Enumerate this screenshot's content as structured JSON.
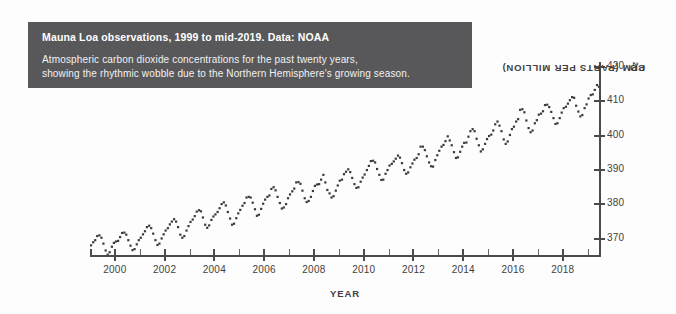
{
  "caption": {
    "title": "Mauna Loa observations, 1999 to mid-2019. Data: NOAA",
    "line1": "Atmospheric carbon dioxide concentrations for the past twenty years,",
    "line2": "showing the rhythmic wobble due to the Northern Hemisphere's growing season."
  },
  "colors": {
    "caption_background": "#58585a",
    "caption_text": "#ffffff",
    "axis": "#4b4b4d",
    "marker": "#3a3a3c",
    "page_background": "#fdfdfd"
  },
  "axis_titles": {
    "x": "YEAR",
    "y_prefix": "CO",
    "y_subscript": "2",
    "y_suffix": " PPM (PARTS PER MILLION)"
  },
  "chart_data": {
    "type": "scatter",
    "title": "Mauna Loa observations, 1999 to mid-2019. Data: NOAA",
    "subtitle": "Atmospheric carbon dioxide concentrations for the past twenty years, showing the rhythmic wobble due to the Northern Hemisphere's growing season.",
    "xlabel": "YEAR",
    "ylabel": "CO2 PPM (PARTS PER MILLION)",
    "xlim": [
      1999.0,
      2019.5
    ],
    "ylim": [
      365.0,
      422.0
    ],
    "grid": false,
    "legend": "none",
    "marker": "small-square",
    "x_major_ticks": [
      2000,
      2002,
      2004,
      2006,
      2008,
      2010,
      2012,
      2014,
      2016,
      2018
    ],
    "x_minor_ticks": [
      2001,
      2003,
      2005,
      2007,
      2009,
      2011,
      2013,
      2015,
      2017,
      2019
    ],
    "x_tick_labels": [
      "2000",
      "2002",
      "2004",
      "2006",
      "2008",
      "2010",
      "2012",
      "2014",
      "2016",
      "2018"
    ],
    "y_ticks": [
      370,
      380,
      390,
      400,
      410,
      420
    ],
    "y_tick_labels": [
      "370",
      "380",
      "390",
      "400",
      "410",
      "420"
    ],
    "series": [
      {
        "name": "Monthly mean CO2 (ppm)",
        "x": [
          1999.04,
          1999.13,
          1999.21,
          1999.29,
          1999.38,
          1999.46,
          1999.54,
          1999.63,
          1999.71,
          1999.79,
          1999.88,
          1999.96,
          2000.04,
          2000.13,
          2000.21,
          2000.29,
          2000.38,
          2000.46,
          2000.54,
          2000.63,
          2000.71,
          2000.79,
          2000.88,
          2000.96,
          2001.04,
          2001.13,
          2001.21,
          2001.29,
          2001.38,
          2001.46,
          2001.54,
          2001.63,
          2001.71,
          2001.79,
          2001.88,
          2001.96,
          2002.04,
          2002.13,
          2002.21,
          2002.29,
          2002.38,
          2002.46,
          2002.54,
          2002.63,
          2002.71,
          2002.79,
          2002.88,
          2002.96,
          2003.04,
          2003.13,
          2003.21,
          2003.29,
          2003.38,
          2003.46,
          2003.54,
          2003.63,
          2003.71,
          2003.79,
          2003.88,
          2003.96,
          2004.04,
          2004.13,
          2004.21,
          2004.29,
          2004.38,
          2004.46,
          2004.54,
          2004.63,
          2004.71,
          2004.79,
          2004.88,
          2004.96,
          2005.04,
          2005.13,
          2005.21,
          2005.29,
          2005.38,
          2005.46,
          2005.54,
          2005.63,
          2005.71,
          2005.79,
          2005.88,
          2005.96,
          2006.04,
          2006.13,
          2006.21,
          2006.29,
          2006.38,
          2006.46,
          2006.54,
          2006.63,
          2006.71,
          2006.79,
          2006.88,
          2006.96,
          2007.04,
          2007.13,
          2007.21,
          2007.29,
          2007.38,
          2007.46,
          2007.54,
          2007.63,
          2007.71,
          2007.79,
          2007.88,
          2007.96,
          2008.04,
          2008.13,
          2008.21,
          2008.29,
          2008.38,
          2008.46,
          2008.54,
          2008.63,
          2008.71,
          2008.79,
          2008.88,
          2008.96,
          2009.04,
          2009.13,
          2009.21,
          2009.29,
          2009.38,
          2009.46,
          2009.54,
          2009.63,
          2009.71,
          2009.79,
          2009.88,
          2009.96,
          2010.04,
          2010.13,
          2010.21,
          2010.29,
          2010.38,
          2010.46,
          2010.54,
          2010.63,
          2010.71,
          2010.79,
          2010.88,
          2010.96,
          2011.04,
          2011.13,
          2011.21,
          2011.29,
          2011.38,
          2011.46,
          2011.54,
          2011.63,
          2011.71,
          2011.79,
          2011.88,
          2011.96,
          2012.04,
          2012.13,
          2012.21,
          2012.29,
          2012.38,
          2012.46,
          2012.54,
          2012.63,
          2012.71,
          2012.79,
          2012.88,
          2012.96,
          2013.04,
          2013.13,
          2013.21,
          2013.29,
          2013.38,
          2013.46,
          2013.54,
          2013.63,
          2013.71,
          2013.79,
          2013.88,
          2013.96,
          2014.04,
          2014.13,
          2014.21,
          2014.29,
          2014.38,
          2014.46,
          2014.54,
          2014.63,
          2014.71,
          2014.79,
          2014.88,
          2014.96,
          2015.04,
          2015.13,
          2015.21,
          2015.29,
          2015.38,
          2015.46,
          2015.54,
          2015.63,
          2015.71,
          2015.79,
          2015.88,
          2015.96,
          2016.04,
          2016.13,
          2016.21,
          2016.29,
          2016.38,
          2016.46,
          2016.54,
          2016.63,
          2016.71,
          2016.79,
          2016.88,
          2016.96,
          2017.04,
          2017.13,
          2017.21,
          2017.29,
          2017.38,
          2017.46,
          2017.54,
          2017.63,
          2017.71,
          2017.79,
          2017.88,
          2017.96,
          2018.04,
          2018.13,
          2018.21,
          2018.29,
          2018.38,
          2018.46,
          2018.54,
          2018.63,
          2018.71,
          2018.79,
          2018.88,
          2018.96,
          2019.04,
          2019.13,
          2019.21,
          2019.29,
          2019.38,
          2019.46
        ],
        "values": [
          368.1,
          369.0,
          369.6,
          370.8,
          371.0,
          370.3,
          368.6,
          366.6,
          365.4,
          366.1,
          367.7,
          368.8,
          369.2,
          369.4,
          370.5,
          371.7,
          371.8,
          371.2,
          369.6,
          368.0,
          366.7,
          367.0,
          368.4,
          369.6,
          370.3,
          371.3,
          372.2,
          373.4,
          373.8,
          373.1,
          371.5,
          369.6,
          368.2,
          368.6,
          370.1,
          371.3,
          372.4,
          373.1,
          374.2,
          375.0,
          375.7,
          375.0,
          373.4,
          371.2,
          370.3,
          370.8,
          372.4,
          373.7,
          374.9,
          375.6,
          376.6,
          377.9,
          378.3,
          378.0,
          376.2,
          374.1,
          373.2,
          373.9,
          375.5,
          376.5,
          377.1,
          377.8,
          378.9,
          380.1,
          380.6,
          379.7,
          377.8,
          375.9,
          374.1,
          374.4,
          376.0,
          377.4,
          378.4,
          379.6,
          380.4,
          382.0,
          382.2,
          382.0,
          380.5,
          378.6,
          376.7,
          377.0,
          378.7,
          380.2,
          381.4,
          382.2,
          382.6,
          384.5,
          385.0,
          384.1,
          382.2,
          380.4,
          378.8,
          379.1,
          380.1,
          381.8,
          382.9,
          383.8,
          384.6,
          386.4,
          386.5,
          386.0,
          384.0,
          381.8,
          380.7,
          381.0,
          382.2,
          383.9,
          385.4,
          385.8,
          385.9,
          387.2,
          388.6,
          386.4,
          384.2,
          383.2,
          382.0,
          382.4,
          384.0,
          385.5,
          386.9,
          387.2,
          388.8,
          389.5,
          390.2,
          389.4,
          387.7,
          385.9,
          384.8,
          385.0,
          386.6,
          387.8,
          388.7,
          390.0,
          391.2,
          392.6,
          392.7,
          392.2,
          390.3,
          388.6,
          387.1,
          387.2,
          388.9,
          390.0,
          391.3,
          391.8,
          392.5,
          393.3,
          394.2,
          393.6,
          392.0,
          390.0,
          388.9,
          389.3,
          390.8,
          391.9,
          393.0,
          393.5,
          394.6,
          396.8,
          396.8,
          395.8,
          394.0,
          392.2,
          391.1,
          391.0,
          392.9,
          394.3,
          395.6,
          396.8,
          397.3,
          398.4,
          399.8,
          398.6,
          397.2,
          395.2,
          393.5,
          393.7,
          395.3,
          396.8,
          397.9,
          398.0,
          399.7,
          401.3,
          401.9,
          401.3,
          399.1,
          397.2,
          395.4,
          396.0,
          397.6,
          399.0,
          399.9,
          400.3,
          401.5,
          403.3,
          404.1,
          402.9,
          401.3,
          398.9,
          397.6,
          398.3,
          400.2,
          401.9,
          402.6,
          404.1,
          404.8,
          407.5,
          407.7,
          406.8,
          404.4,
          402.2,
          401.0,
          401.5,
          403.6,
          404.5,
          406.1,
          406.4,
          407.1,
          408.9,
          409.0,
          408.3,
          406.9,
          405.1,
          403.4,
          403.6,
          405.1,
          406.7,
          408.0,
          408.4,
          409.3,
          410.3,
          411.2,
          411.0,
          408.7,
          407.0,
          405.6,
          406.0,
          408.0,
          409.1,
          410.8,
          411.8,
          412.0,
          413.3,
          414.7,
          414.2
        ]
      }
    ]
  }
}
